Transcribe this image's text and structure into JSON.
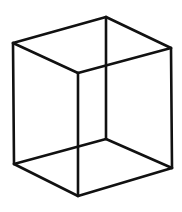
{
  "figure": {
    "stroke_color": "#111111",
    "background_color": "#ffffff",
    "vertices": [
      "top-left",
      "top-back",
      "top-right",
      "top-front",
      "bottom-left",
      "bottom-back",
      "bottom-right",
      "bottom-front"
    ],
    "edges": [
      [
        "top-left",
        "top-back"
      ],
      [
        "top-back",
        "top-right"
      ],
      [
        "top-right",
        "top-front"
      ],
      [
        "top-front",
        "top-left"
      ],
      [
        "bottom-left",
        "bottom-back"
      ],
      [
        "bottom-back",
        "bottom-right"
      ],
      [
        "bottom-right",
        "bottom-front"
      ],
      [
        "bottom-front",
        "bottom-left"
      ],
      [
        "top-left",
        "bottom-left"
      ],
      [
        "top-back",
        "bottom-back"
      ],
      [
        "top-right",
        "bottom-right"
      ],
      [
        "top-front",
        "bottom-front"
      ]
    ]
  }
}
